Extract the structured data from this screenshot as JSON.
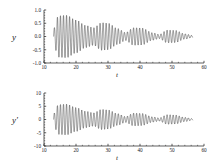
{
  "figure": {
    "background_color": "#ffffff",
    "curve_color": "#1a1a1a"
  },
  "panels": [
    {
      "id": "displacement",
      "ylabel": "y",
      "xlabel": "t",
      "y_ticks": [
        "1.0",
        "0.5",
        "0.0",
        "-0.5",
        "-1.0"
      ],
      "x_ticks": [
        "10",
        "20",
        "30",
        "40",
        "50",
        "60"
      ]
    },
    {
      "id": "velocity",
      "ylabel": "y'",
      "xlabel": "t",
      "y_ticks": [
        "10",
        "5",
        "0",
        "-5",
        "-10"
      ],
      "x_ticks": [
        "10",
        "20",
        "30",
        "40",
        "50",
        "60"
      ]
    }
  ],
  "chart_data": [
    {
      "type": "line",
      "title": "",
      "xlabel": "t",
      "ylabel": "y",
      "xlim": [
        10,
        60
      ],
      "ylim": [
        -1.0,
        1.0
      ],
      "xticks": [
        10,
        20,
        30,
        40,
        50,
        60
      ],
      "yticks": [
        -1.0,
        -0.5,
        0.0,
        0.5,
        1.0
      ],
      "grid": false,
      "legend": "none",
      "description": "Beating oscillation with decaying envelope; signal begins near t=13 and ends near t=56.5.",
      "signal_model": {
        "start_t": 13.0,
        "end_t": 56.5,
        "carrier_frequency": 6.6,
        "beat_frequency": 0.52,
        "beat_phase": 1.2,
        "envelope_peak": 0.8,
        "envelope_decay": 0.052,
        "envelope_floor": 0.12
      },
      "envelope_points": [
        {
          "t": 13.0,
          "amplitude": 0.3
        },
        {
          "t": 14.5,
          "amplitude": 0.78
        },
        {
          "t": 17.0,
          "amplitude": 0.8
        },
        {
          "t": 20.0,
          "amplitude": 0.62
        },
        {
          "t": 23.0,
          "amplitude": 0.42
        },
        {
          "t": 25.5,
          "amplitude": 0.33
        },
        {
          "t": 28.0,
          "amplitude": 0.52
        },
        {
          "t": 30.0,
          "amplitude": 0.5
        },
        {
          "t": 33.0,
          "amplitude": 0.3
        },
        {
          "t": 35.5,
          "amplitude": 0.15
        },
        {
          "t": 38.0,
          "amplitude": 0.33
        },
        {
          "t": 40.5,
          "amplitude": 0.32
        },
        {
          "t": 44.0,
          "amplitude": 0.14
        },
        {
          "t": 46.0,
          "amplitude": 0.08
        },
        {
          "t": 48.5,
          "amplitude": 0.24
        },
        {
          "t": 51.0,
          "amplitude": 0.23
        },
        {
          "t": 54.0,
          "amplitude": 0.1
        },
        {
          "t": 56.5,
          "amplitude": 0.04
        }
      ]
    },
    {
      "type": "line",
      "title": "",
      "xlabel": "t",
      "ylabel": "y'",
      "xlim": [
        10,
        60
      ],
      "ylim": [
        -10,
        10
      ],
      "xticks": [
        10,
        20,
        30,
        40,
        50,
        60
      ],
      "yticks": [
        -10,
        -5,
        0,
        5,
        10
      ],
      "grid": false,
      "legend": "none",
      "description": "Derivative of the displacement: same beating structure, amplitude scaled to about +/-6 at its peak.",
      "signal_model": {
        "start_t": 13.0,
        "end_t": 56.5,
        "carrier_frequency": 6.6,
        "beat_frequency": 0.52,
        "beat_phase": 1.2,
        "envelope_peak": 5.8,
        "envelope_decay": 0.052,
        "envelope_floor": 0.9
      },
      "envelope_points": [
        {
          "t": 13.0,
          "amplitude": 2.2
        },
        {
          "t": 14.5,
          "amplitude": 5.6
        },
        {
          "t": 17.0,
          "amplitude": 5.8
        },
        {
          "t": 20.0,
          "amplitude": 4.5
        },
        {
          "t": 23.0,
          "amplitude": 3.1
        },
        {
          "t": 25.5,
          "amplitude": 2.5
        },
        {
          "t": 28.0,
          "amplitude": 3.8
        },
        {
          "t": 30.0,
          "amplitude": 3.6
        },
        {
          "t": 33.0,
          "amplitude": 2.2
        },
        {
          "t": 35.5,
          "amplitude": 1.1
        },
        {
          "t": 38.0,
          "amplitude": 2.4
        },
        {
          "t": 40.5,
          "amplitude": 2.3
        },
        {
          "t": 44.0,
          "amplitude": 1.0
        },
        {
          "t": 46.0,
          "amplitude": 0.6
        },
        {
          "t": 48.5,
          "amplitude": 1.8
        },
        {
          "t": 51.0,
          "amplitude": 1.7
        },
        {
          "t": 54.0,
          "amplitude": 0.8
        },
        {
          "t": 56.5,
          "amplitude": 0.3
        }
      ]
    }
  ]
}
